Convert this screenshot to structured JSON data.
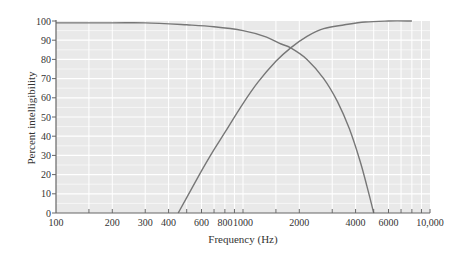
{
  "chart_data": {
    "type": "line",
    "title": "",
    "xlabel": "Frequency (Hz)",
    "ylabel": "Percent intelligibility",
    "xscale": "log",
    "xlim": [
      100,
      10000
    ],
    "ylim": [
      0,
      100
    ],
    "grid": true,
    "legend": null,
    "x_ticks": [
      {
        "value": 100,
        "label": "100"
      },
      {
        "value": 200,
        "label": "200"
      },
      {
        "value": 300,
        "label": "300"
      },
      {
        "value": 400,
        "label": "400"
      },
      {
        "value": 600,
        "label": "600"
      },
      {
        "value": 800,
        "label": "800"
      },
      {
        "value": 1000,
        "label": "1000"
      },
      {
        "value": 2000,
        "label": "2000"
      },
      {
        "value": 4000,
        "label": "4000"
      },
      {
        "value": 6000,
        "label": "6000"
      },
      {
        "value": 10000,
        "label": "10,000"
      }
    ],
    "x_minor_ticks": [
      150,
      200,
      300,
      400,
      500,
      600,
      700,
      800,
      900,
      1000,
      1500,
      2000,
      3000,
      4000,
      5000,
      6000,
      7000,
      8000,
      9000
    ],
    "y_ticks": [
      0,
      10,
      20,
      30,
      40,
      50,
      60,
      70,
      80,
      90,
      100
    ],
    "series": [
      {
        "name": "Low-pass filtered (frequencies above cutoff removed)",
        "x": [
          100,
          200,
          300,
          500,
          700,
          1000,
          1300,
          1600,
          1800,
          2200,
          2700,
          3200,
          3700,
          4200,
          4600,
          5000
        ],
        "y": [
          99,
          99,
          99,
          98,
          97,
          95,
          92,
          88,
          86,
          80,
          70,
          58,
          44,
          28,
          14,
          0
        ]
      },
      {
        "name": "High-pass filtered (frequencies below cutoff removed)",
        "x": [
          450,
          500,
          600,
          700,
          800,
          1000,
          1200,
          1500,
          1800,
          2200,
          2700,
          3500,
          4500,
          6000,
          8000
        ],
        "y": [
          0,
          8,
          22,
          33,
          42,
          57,
          68,
          79,
          86,
          92,
          96,
          98,
          99.5,
          100,
          100
        ]
      }
    ],
    "crossover": {
      "x": 1800,
      "y": 86
    }
  },
  "axes": {
    "x_title": "Frequency (Hz)",
    "y_title": "Percent intelligibility"
  },
  "colors": {
    "plot_background": "#e9e9e9",
    "grid": "#ffffff",
    "axis": "#666666",
    "line": "#777777",
    "text": "#333333"
  }
}
